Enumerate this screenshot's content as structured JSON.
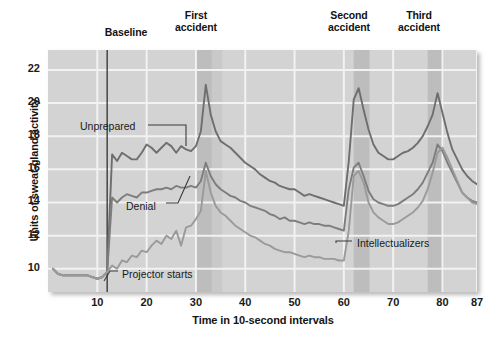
{
  "figure": {
    "top_labels": [
      {
        "id": "baseline",
        "text": "Baseline"
      },
      {
        "id": "first",
        "text": "First\naccident"
      },
      {
        "id": "second",
        "text": "Second\naccident"
      },
      {
        "id": "third",
        "text": "Third\naccident"
      }
    ],
    "annotations": [
      {
        "id": "unprepared",
        "text": "Unprepared"
      },
      {
        "id": "denial",
        "text": "Denial"
      },
      {
        "id": "projector",
        "text": "Projector starts"
      },
      {
        "id": "intellectualizers",
        "text": "Intellectualizers"
      }
    ],
    "colors": {
      "plot_background": "#d3d3d3",
      "band_shade": "#bdbdbd",
      "gridline": "#f2f2f2",
      "line_unprepared": "#6e6e6e",
      "line_denial": "#7d7d7d",
      "line_intellectualizers": "#9a9a9a",
      "marker_line": "#3b3b3b",
      "text": "#141414"
    }
  },
  "chart_data": {
    "type": "line",
    "title": "",
    "xlabel": "Time in 10-second intervals",
    "ylabel": "Units of sweat-gland activity",
    "xlim": [
      0,
      87
    ],
    "ylim": [
      8.6,
      23.2
    ],
    "xticks": [
      10,
      20,
      30,
      40,
      50,
      60,
      70,
      80,
      87
    ],
    "yticks": [
      10,
      12,
      14,
      16,
      18,
      20,
      22
    ],
    "grid": true,
    "legend": "inline-annotations",
    "event_markers": [
      {
        "label": "Projector starts",
        "x": 12,
        "type": "vline"
      }
    ],
    "shaded_bands": [
      {
        "label": "First accident",
        "x0": 30.0,
        "x1": 33.2
      },
      {
        "label": "First accident (trail)",
        "x0": 33.2,
        "x1": 35.3
      },
      {
        "label": "Second accident",
        "x0": 62.0,
        "x1": 65.2
      },
      {
        "label": "Third accident",
        "x0": 77.0,
        "x1": 80.2
      }
    ],
    "series": [
      {
        "name": "Unprepared",
        "color": "#6e6e6e",
        "x": [
          1,
          2,
          3,
          4,
          5,
          6,
          7,
          8,
          9,
          10,
          11,
          12,
          13,
          14,
          15,
          16,
          17,
          18,
          19,
          20,
          21,
          22,
          23,
          24,
          25,
          26,
          27,
          28,
          29,
          30,
          31,
          32,
          33,
          34,
          35,
          36,
          37,
          38,
          39,
          40,
          41,
          42,
          43,
          44,
          45,
          46,
          47,
          48,
          49,
          50,
          51,
          52,
          53,
          54,
          55,
          56,
          57,
          58,
          59,
          60,
          61,
          62,
          63,
          64,
          65,
          66,
          67,
          68,
          69,
          70,
          71,
          72,
          73,
          74,
          75,
          76,
          77,
          78,
          79,
          80,
          81,
          82,
          83,
          84,
          85,
          86,
          87
        ],
        "values": [
          10.0,
          9.7,
          9.6,
          9.6,
          9.6,
          9.6,
          9.6,
          9.6,
          9.5,
          9.4,
          9.5,
          9.8,
          16.9,
          16.5,
          17.0,
          16.8,
          16.6,
          16.6,
          17.0,
          17.5,
          17.3,
          17.0,
          17.3,
          17.6,
          17.4,
          17.0,
          17.4,
          17.2,
          17.1,
          17.4,
          18.3,
          21.1,
          19.3,
          18.3,
          17.7,
          17.5,
          17.3,
          17.0,
          16.7,
          16.4,
          16.2,
          16.0,
          15.7,
          15.5,
          15.3,
          15.2,
          15.0,
          14.9,
          14.8,
          14.8,
          14.6,
          14.4,
          14.5,
          14.4,
          14.3,
          14.2,
          14.1,
          14.0,
          13.9,
          13.8,
          16.5,
          20.2,
          20.9,
          19.6,
          18.4,
          17.5,
          17.0,
          16.8,
          16.6,
          16.6,
          16.8,
          17.0,
          17.1,
          17.3,
          17.6,
          18.0,
          18.6,
          19.3,
          20.6,
          19.4,
          18.2,
          17.2,
          16.6,
          16.0,
          15.6,
          15.3,
          15.1
        ]
      },
      {
        "name": "Denial",
        "color": "#7d7d7d",
        "x": [
          1,
          2,
          3,
          4,
          5,
          6,
          7,
          8,
          9,
          10,
          11,
          12,
          13,
          14,
          15,
          16,
          17,
          18,
          19,
          20,
          21,
          22,
          23,
          24,
          25,
          26,
          27,
          28,
          29,
          30,
          31,
          32,
          33,
          34,
          35,
          36,
          37,
          38,
          39,
          40,
          41,
          42,
          43,
          44,
          45,
          46,
          47,
          48,
          49,
          50,
          51,
          52,
          53,
          54,
          55,
          56,
          57,
          58,
          59,
          60,
          61,
          62,
          63,
          64,
          65,
          66,
          67,
          68,
          69,
          70,
          71,
          72,
          73,
          74,
          75,
          76,
          77,
          78,
          79,
          80,
          81,
          82,
          83,
          84,
          85,
          86,
          87
        ],
        "values": [
          10.0,
          9.7,
          9.6,
          9.6,
          9.6,
          9.6,
          9.6,
          9.6,
          9.5,
          9.4,
          9.5,
          9.8,
          14.3,
          14.0,
          14.3,
          14.5,
          14.4,
          14.3,
          14.6,
          14.6,
          14.7,
          14.8,
          14.8,
          14.9,
          14.8,
          15.0,
          14.9,
          14.9,
          15.0,
          14.9,
          15.3,
          16.4,
          15.6,
          15.1,
          14.8,
          14.6,
          14.4,
          14.3,
          14.1,
          14.0,
          13.8,
          13.7,
          13.6,
          13.5,
          13.3,
          13.2,
          13.0,
          13.1,
          12.9,
          12.9,
          12.8,
          12.7,
          12.8,
          12.7,
          12.7,
          12.6,
          12.6,
          12.5,
          12.4,
          12.3,
          14.8,
          16.1,
          16.4,
          15.6,
          14.7,
          14.2,
          14.0,
          13.9,
          13.8,
          13.8,
          13.9,
          14.1,
          14.3,
          14.5,
          14.8,
          15.2,
          15.8,
          16.4,
          17.5,
          17.1,
          16.4,
          15.8,
          15.2,
          14.6,
          14.3,
          14.1,
          14.0
        ]
      },
      {
        "name": "Intellectualizers",
        "color": "#9a9a9a",
        "x": [
          1,
          2,
          3,
          4,
          5,
          6,
          7,
          8,
          9,
          10,
          11,
          12,
          13,
          14,
          15,
          16,
          17,
          18,
          19,
          20,
          21,
          22,
          23,
          24,
          25,
          26,
          27,
          28,
          29,
          30,
          31,
          32,
          33,
          34,
          35,
          36,
          37,
          38,
          39,
          40,
          41,
          42,
          43,
          44,
          45,
          46,
          47,
          48,
          49,
          50,
          51,
          52,
          53,
          54,
          55,
          56,
          57,
          58,
          59,
          60,
          61,
          62,
          63,
          64,
          65,
          66,
          67,
          68,
          69,
          70,
          71,
          72,
          73,
          74,
          75,
          76,
          77,
          78,
          79,
          80,
          81,
          82,
          83,
          84,
          85,
          86,
          87
        ],
        "values": [
          10.0,
          9.7,
          9.6,
          9.6,
          9.6,
          9.6,
          9.6,
          9.6,
          9.5,
          9.4,
          9.5,
          9.8,
          10.2,
          10.0,
          10.5,
          10.4,
          10.8,
          10.7,
          11.1,
          11.0,
          11.4,
          11.7,
          11.5,
          12.0,
          11.8,
          12.3,
          11.4,
          12.5,
          12.6,
          13.0,
          13.5,
          15.9,
          14.6,
          13.8,
          13.4,
          13.2,
          12.9,
          12.6,
          12.4,
          12.2,
          12.0,
          11.9,
          11.7,
          11.5,
          11.4,
          11.2,
          11.1,
          11.0,
          11.0,
          10.9,
          10.8,
          10.7,
          10.8,
          10.7,
          10.7,
          10.6,
          10.6,
          10.6,
          10.5,
          10.5,
          12.3,
          15.6,
          15.9,
          15.2,
          14.0,
          13.4,
          13.1,
          12.9,
          12.7,
          12.7,
          12.8,
          13.0,
          13.2,
          13.4,
          13.7,
          14.1,
          14.8,
          15.8,
          17.0,
          17.3,
          16.7,
          16.0,
          15.3,
          14.6,
          14.3,
          14.0,
          13.9
        ]
      }
    ]
  }
}
